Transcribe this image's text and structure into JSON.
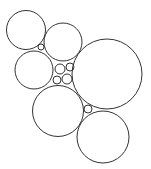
{
  "diagram": {
    "type": "circle-packing",
    "stroke_color": "#333333",
    "background": "#ffffff",
    "circles": [
      {
        "id": "top-left",
        "cx": 26,
        "cy": 30,
        "r": 19.5
      },
      {
        "id": "top-middle",
        "cx": 63,
        "cy": 42,
        "r": 19
      },
      {
        "id": "middle-left",
        "cx": 34,
        "cy": 70,
        "r": 19
      },
      {
        "id": "large-right",
        "cx": 107,
        "cy": 74,
        "r": 35
      },
      {
        "id": "bottom-middle",
        "cx": 58,
        "cy": 111,
        "r": 25.5
      },
      {
        "id": "bottom-right",
        "cx": 103,
        "cy": 137,
        "r": 26
      },
      {
        "id": "small-gap-top",
        "cx": 41,
        "cy": 47,
        "r": 3
      },
      {
        "id": "small-center-1",
        "cx": 60,
        "cy": 69,
        "r": 5
      },
      {
        "id": "small-center-2",
        "cx": 70,
        "cy": 67,
        "r": 4
      },
      {
        "id": "small-center-3",
        "cx": 57,
        "cy": 80,
        "r": 4
      },
      {
        "id": "small-center-4",
        "cx": 67,
        "cy": 79,
        "r": 5
      },
      {
        "id": "small-gap-bottom",
        "cx": 88,
        "cy": 109,
        "r": 4
      }
    ]
  }
}
